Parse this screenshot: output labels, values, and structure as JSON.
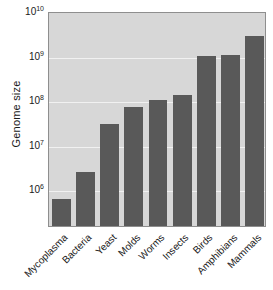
{
  "chart_data": {
    "type": "bar",
    "title": "",
    "xlabel": "",
    "ylabel": "Genome size",
    "yscale": "log",
    "ylim": [
      300000,
      10000000000
    ],
    "grid": true,
    "legend": false,
    "categories": [
      "Mycoplasma",
      "Bacteria",
      "Yeast",
      "Molds",
      "Worms",
      "Insects",
      "Birds",
      "Amphibians",
      "Mammals"
    ],
    "values": [
      600000,
      2500000,
      30000000.0,
      70000000.0,
      100000000.0,
      130000000.0,
      1000000000.0,
      1050000000.0,
      2800000000.0
    ],
    "ytick_labels": [
      "10",
      "10",
      "10",
      "10",
      "10"
    ],
    "ytick_exponents": [
      "10",
      "9",
      "8",
      "7",
      "6"
    ],
    "ytick_values": [
      10000000000,
      1000000000,
      100000000,
      10000000,
      1000000
    ],
    "colors": {
      "bar": "#595959",
      "plot_background": "#d7d7d7",
      "gridline": "#f1f1f1",
      "axis": "#8e8e8e",
      "text": "#1a1a1a",
      "figure_background": "#ffffff"
    }
  },
  "axes": {
    "y_title": "Genome size",
    "y_ticks": [
      {
        "mantissa": "10",
        "exponent": "10"
      },
      {
        "mantissa": "10",
        "exponent": "9"
      },
      {
        "mantissa": "10",
        "exponent": "8"
      },
      {
        "mantissa": "10",
        "exponent": "7"
      },
      {
        "mantissa": "10",
        "exponent": "6"
      }
    ],
    "x_ticks": [
      {
        "label": "Mycoplasma"
      },
      {
        "label": "Bacteria"
      },
      {
        "label": "Yeast"
      },
      {
        "label": "Molds"
      },
      {
        "label": "Worms"
      },
      {
        "label": "Insects"
      },
      {
        "label": "Birds"
      },
      {
        "label": "Amphibians"
      },
      {
        "label": "Mammals"
      }
    ]
  }
}
